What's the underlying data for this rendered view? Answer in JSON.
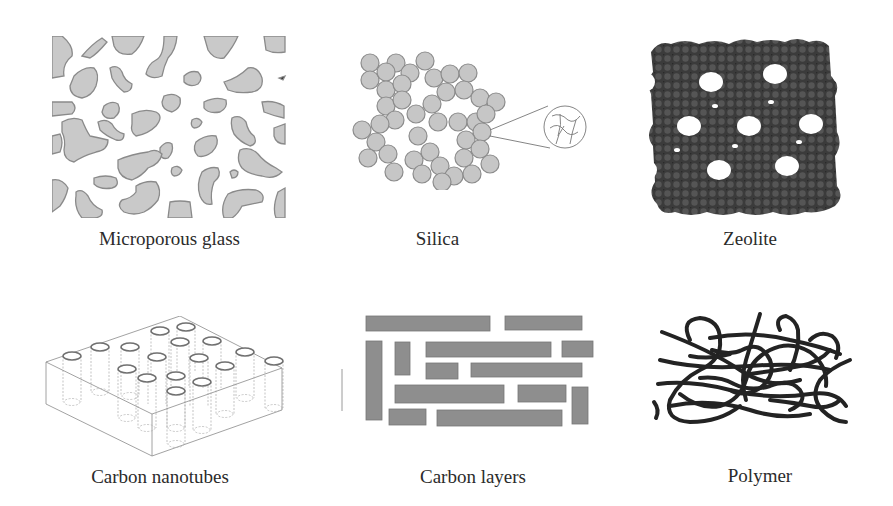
{
  "figure": {
    "panels": [
      {
        "id": "microporous-glass",
        "caption": "Microporous glass"
      },
      {
        "id": "silica",
        "caption": "Silica"
      },
      {
        "id": "zeolite",
        "caption": "Zeolite"
      },
      {
        "id": "carbon-nanotubes",
        "caption": "Carbon nanotubes"
      },
      {
        "id": "carbon-layers",
        "caption": "Carbon layers"
      },
      {
        "id": "polymer",
        "caption": "Polymer"
      }
    ]
  },
  "colors": {
    "background": "#ffffff",
    "light_gray_fill": "#c8c8c8",
    "gray_outline": "#8a8a8a",
    "dark_fill": "#3a3a3a",
    "polymer_stroke": "#222222",
    "caption_text": "#2b2b2b"
  }
}
